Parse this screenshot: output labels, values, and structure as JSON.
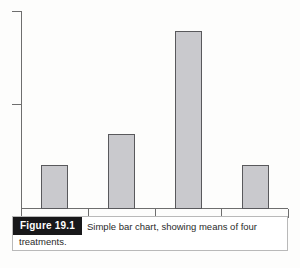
{
  "figure": {
    "label": "Figure 19.1",
    "caption_line1": "Simple bar chart, showing means of four",
    "caption_line2": "treatments."
  },
  "colors": {
    "bar_fill": "#c9c9cd",
    "bar_stroke": "#59595c",
    "axis": "#6e6e6e",
    "label_bg": "#18181a",
    "label_fg": "#ffffff",
    "page_bg": "#fdfdfc"
  },
  "chart_data": {
    "type": "bar",
    "title": "",
    "xlabel": "",
    "ylabel": "",
    "categories": [
      "1",
      "2",
      "3",
      "4"
    ],
    "values": [
      22.5,
      38.0,
      90.5,
      22.5
    ],
    "ylim": [
      0,
      100
    ],
    "grid": false,
    "legend": null,
    "tick_labels": {
      "x": [
        "",
        "",
        "",
        "",
        ""
      ],
      "y": [
        "",
        ""
      ]
    }
  }
}
